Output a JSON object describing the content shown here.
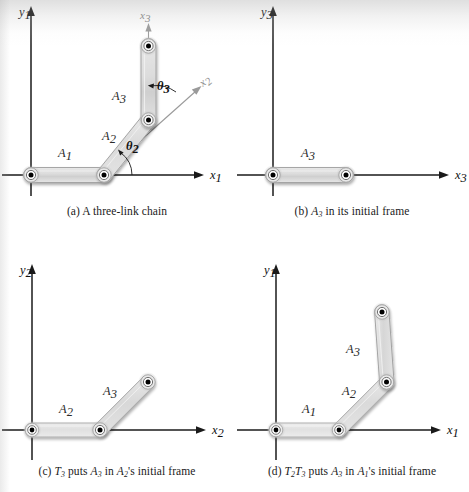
{
  "figure": {
    "type": "kinematic-chain-diagram",
    "panel_count": 4
  },
  "panels": [
    {
      "id": "a",
      "caption_prefix": "(a)",
      "caption_text": "A three-link chain",
      "axes": {
        "x_label": "x",
        "x_sub": "1",
        "y_label": "y",
        "y_sub": "1",
        "aux_axes": [
          {
            "label": "x",
            "sub": "2",
            "orientation": "diagonal-45",
            "color": "#8a8a8a"
          },
          {
            "label": "x",
            "sub": "3",
            "orientation": "vertical",
            "color": "#8a8a8a"
          }
        ]
      },
      "links": [
        {
          "label": "A",
          "sub": "1",
          "orientation": "horizontal"
        },
        {
          "label": "A",
          "sub": "2",
          "orientation": "diagonal-45"
        },
        {
          "label": "A",
          "sub": "3",
          "orientation": "vertical"
        }
      ],
      "angles": [
        {
          "label": "θ",
          "sub": "2"
        },
        {
          "label": "θ",
          "sub": "3"
        }
      ]
    },
    {
      "id": "b",
      "caption_prefix": "(b)",
      "caption_link": "A",
      "caption_link_sub": "3",
      "caption_text": "in its initial frame",
      "axes": {
        "x_label": "x",
        "x_sub": "3",
        "y_label": "y",
        "y_sub": "3",
        "aux_axes": []
      },
      "links": [
        {
          "label": "A",
          "sub": "3",
          "orientation": "horizontal"
        }
      ],
      "angles": []
    },
    {
      "id": "c",
      "caption_prefix": "(c)",
      "caption_transform": "T",
      "caption_transform_sub": "3",
      "caption_verb": "puts",
      "caption_subject": "A",
      "caption_subject_sub": "3",
      "caption_mid": "in",
      "caption_frame": "A",
      "caption_frame_sub": "2",
      "caption_tail": "'s initial frame",
      "axes": {
        "x_label": "x",
        "x_sub": "2",
        "y_label": "y",
        "y_sub": "2",
        "aux_axes": []
      },
      "links": [
        {
          "label": "A",
          "sub": "2",
          "orientation": "horizontal"
        },
        {
          "label": "A",
          "sub": "3",
          "orientation": "diagonal-45"
        }
      ],
      "angles": []
    },
    {
      "id": "d",
      "caption_prefix": "(d)",
      "caption_transform": "T",
      "caption_transform_sub": "2",
      "caption_transform2": "T",
      "caption_transform2_sub": "3",
      "caption_verb": "puts",
      "caption_subject": "A",
      "caption_subject_sub": "3",
      "caption_mid": "in",
      "caption_frame": "A",
      "caption_frame_sub": "1",
      "caption_tail": "'s initial frame",
      "axes": {
        "x_label": "x",
        "x_sub": "1",
        "y_label": "y",
        "y_sub": "1",
        "aux_axes": []
      },
      "links": [
        {
          "label": "A",
          "sub": "1",
          "orientation": "horizontal"
        },
        {
          "label": "A",
          "sub": "2",
          "orientation": "diagonal-45"
        },
        {
          "label": "A",
          "sub": "3",
          "orientation": "near-vertical"
        }
      ],
      "angles": []
    }
  ],
  "colors": {
    "axis": "#1a1a1a",
    "aux_axis": "#9a9a9a",
    "link_fill": "#d9d9d9",
    "link_fill_light": "#ececec",
    "link_stroke": "#8f8f8f",
    "joint_center": "#000000",
    "text": "#1a1a1a",
    "label_gray": "#8a8a8a",
    "page_bg": "#ffffff"
  }
}
